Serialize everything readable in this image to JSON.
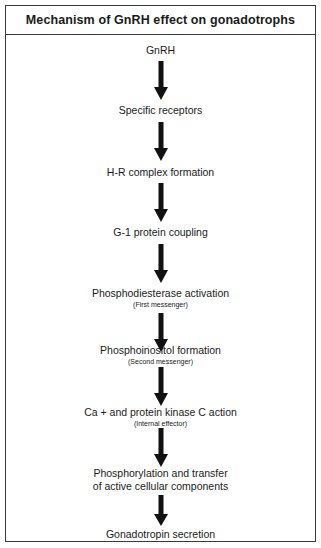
{
  "header": {
    "title": "Mechanism of GnRH effect on gonadotrophs"
  },
  "steps": [
    {
      "label": "GnRH",
      "sub": ""
    },
    {
      "label": "Specific receptors",
      "sub": ""
    },
    {
      "label": "H-R complex formation",
      "sub": ""
    },
    {
      "label": "G-1 protein coupling",
      "sub": ""
    },
    {
      "label": "Phosphodiesterase activation",
      "sub": "(First messenger)"
    },
    {
      "label": "Phosphoinositol formation",
      "sub": "(Second messenger)"
    },
    {
      "label": "Ca +  and protein kinase C action",
      "sub": "(Internal effector)"
    },
    {
      "label": "Phosphorylation and transfer",
      "label2": "of active cellular components",
      "sub": ""
    },
    {
      "label": "Gonadotropin secretion",
      "sub": ""
    }
  ],
  "arrows": {
    "count": 8,
    "color": "#111111",
    "icon": "arrow-down-icon"
  },
  "colors": {
    "border": "#3a3a3a",
    "text": "#1a1a1a",
    "background": "#ffffff"
  }
}
